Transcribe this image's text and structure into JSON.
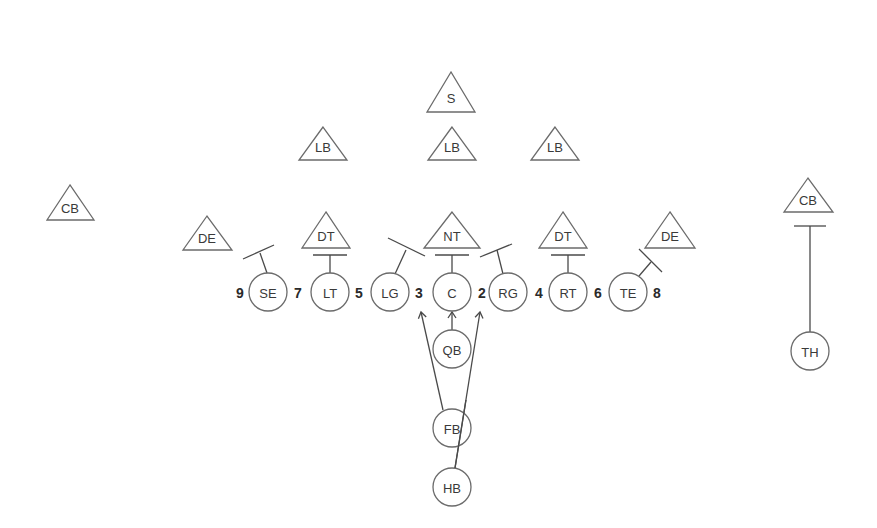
{
  "diagram": {
    "title": "",
    "defense": [
      {
        "id": "s",
        "label": "S"
      },
      {
        "id": "lb-left",
        "label": "LB"
      },
      {
        "id": "lb-middle",
        "label": "LB"
      },
      {
        "id": "lb-right",
        "label": "LB"
      },
      {
        "id": "cb-left",
        "label": "CB"
      },
      {
        "id": "de-left",
        "label": "DE"
      },
      {
        "id": "dt-left",
        "label": "DT"
      },
      {
        "id": "nt",
        "label": "NT"
      },
      {
        "id": "dt-right",
        "label": "DT"
      },
      {
        "id": "de-right",
        "label": "DE"
      },
      {
        "id": "cb-right",
        "label": "CB"
      }
    ],
    "offense": [
      {
        "id": "se",
        "label": "SE"
      },
      {
        "id": "lt",
        "label": "LT"
      },
      {
        "id": "lg",
        "label": "LG"
      },
      {
        "id": "c",
        "label": "C"
      },
      {
        "id": "rg",
        "label": "RG"
      },
      {
        "id": "rt",
        "label": "RT"
      },
      {
        "id": "te",
        "label": "TE"
      },
      {
        "id": "qb",
        "label": "QB"
      },
      {
        "id": "fb",
        "label": "FB"
      },
      {
        "id": "hb",
        "label": "HB"
      },
      {
        "id": "th",
        "label": "TH"
      }
    ],
    "gap_numbers": [
      "9",
      "7",
      "5",
      "3",
      "2",
      "4",
      "6",
      "8"
    ]
  }
}
